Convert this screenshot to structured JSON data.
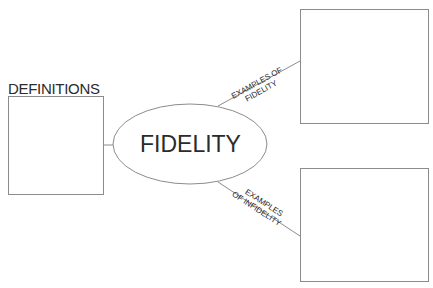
{
  "diagram": {
    "center": {
      "label": "FIDELITY"
    },
    "left_box": {
      "title": "DEFINITIONS"
    },
    "branches": [
      {
        "label_line1": "EXAMPLES OF",
        "label_line2": "FIDELITY"
      },
      {
        "label_line1": "EXAMPLES",
        "label_line2": "OF INFIDELITY"
      }
    ],
    "colors": {
      "stroke": "#8c8c8c",
      "text": "#2b2b2b",
      "background": "#ffffff"
    }
  }
}
